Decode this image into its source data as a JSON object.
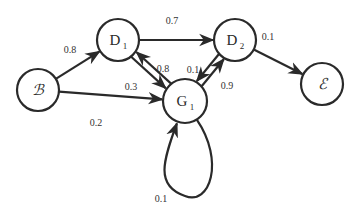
{
  "diagram": {
    "type": "state-transition-graph",
    "colors": {
      "stroke": "#2a2a2a",
      "background": "#ffffff"
    },
    "nodes": [
      {
        "id": "B",
        "label": "ℬ",
        "sub": "",
        "x": 38,
        "y": 90,
        "r": 21
      },
      {
        "id": "D1",
        "label": "D",
        "sub": "1",
        "x": 118,
        "y": 40,
        "r": 21
      },
      {
        "id": "D2",
        "label": "D",
        "sub": "2",
        "x": 235,
        "y": 40,
        "r": 21
      },
      {
        "id": "E",
        "label": "ℰ",
        "sub": "",
        "x": 322,
        "y": 84,
        "r": 21
      },
      {
        "id": "G1",
        "label": "G",
        "sub": "1",
        "x": 185,
        "y": 101,
        "r": 22
      }
    ],
    "edges": [
      {
        "from": "B",
        "to": "D1",
        "weight": "0.8",
        "label_x": 70,
        "label_y": 53
      },
      {
        "from": "B",
        "to": "G1",
        "weight": "0.2",
        "label_x": 96,
        "label_y": 126
      },
      {
        "from": "D1",
        "to": "D2",
        "weight": "0.7",
        "label_x": 172,
        "label_y": 24
      },
      {
        "from": "D1",
        "to": "G1",
        "weight": "0.3",
        "label_x": 131,
        "label_y": 90
      },
      {
        "from": "G1",
        "to": "D1",
        "weight": "0.8",
        "label_x": 163,
        "label_y": 72
      },
      {
        "from": "G1",
        "to": "D2",
        "weight": "0.1",
        "label_x": 193,
        "label_y": 73
      },
      {
        "from": "D2",
        "to": "G1",
        "weight": "0.9",
        "label_x": 227,
        "label_y": 89
      },
      {
        "from": "D2",
        "to": "E",
        "weight": "0.1",
        "label_x": 268,
        "label_y": 40
      },
      {
        "from": "G1",
        "to": "G1",
        "weight": "0.1",
        "label_x": 161,
        "label_y": 202
      }
    ]
  }
}
